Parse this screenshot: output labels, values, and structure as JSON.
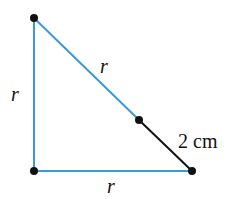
{
  "diagram": {
    "type": "right-triangle",
    "colors": {
      "leg_line": "#3a9ad9",
      "extension_line": "#111111",
      "vertex": "#111111",
      "text": "#111111"
    },
    "vertices": {
      "top": {
        "x": 34,
        "y": 18
      },
      "bottom_left": {
        "x": 34,
        "y": 171
      },
      "bottom_right": {
        "x": 192,
        "y": 171
      },
      "hypotenuse_point": {
        "x": 139,
        "y": 120
      }
    },
    "labels": {
      "left_side": "r",
      "bottom_side": "r",
      "hypotenuse_upper": "r",
      "hypotenuse_extension": "2 cm"
    }
  }
}
